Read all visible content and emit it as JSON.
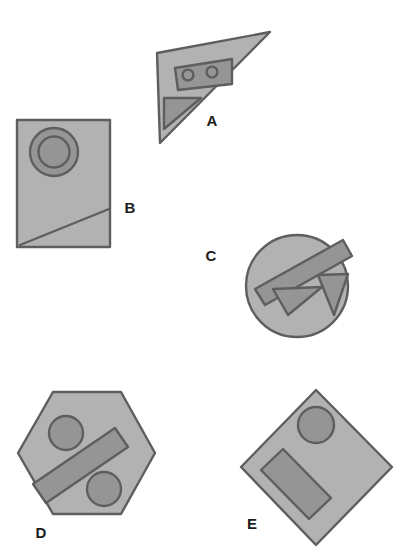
{
  "figure": {
    "background_color": "#ffffff",
    "palette": {
      "shape_fill": "#b2b2b2",
      "shape_outline": "#5e5e5e",
      "feature_fill": "#959595",
      "feature_outline": "#5e5e5e",
      "label_color": "#1b1b1b"
    },
    "stroke_width": 2.4,
    "shapes": [
      {
        "id": "A",
        "label": "A",
        "outline": "triangle",
        "points": "157,53 270,32 160,143",
        "label_x": 212,
        "label_y": 122,
        "features": [
          {
            "name": "inner-rectangle",
            "type": "polygon",
            "points": "175,68 232,59 232,84 178,90"
          },
          {
            "name": "inner-circle-left",
            "type": "circle",
            "cx": 188,
            "cy": 75,
            "r": 5.4
          },
          {
            "name": "inner-circle-right",
            "type": "circle",
            "cx": 212,
            "cy": 72,
            "r": 5.4
          },
          {
            "name": "inner-triangle",
            "type": "polygon",
            "points": "164,98 201,98 164,129"
          }
        ]
      },
      {
        "id": "B",
        "label": "B",
        "outline": "rectangle",
        "points": "17,120 110,120 110,247 17,247",
        "label_x": 130,
        "label_y": 209,
        "features": [
          {
            "name": "outer-ring",
            "type": "circle",
            "cx": 54,
            "cy": 152,
            "r": 24
          },
          {
            "name": "inner-ring",
            "type": "circle",
            "cx": 54,
            "cy": 152,
            "r": 15.5
          },
          {
            "name": "diagonal-line",
            "type": "line",
            "x1": 20,
            "y1": 245,
            "x2": 109,
            "y2": 209
          }
        ]
      },
      {
        "id": "C",
        "label": "C",
        "outline": "circle",
        "cx": 297,
        "cy": 286,
        "r": 51,
        "label_x": 211,
        "label_y": 257,
        "features": [
          {
            "name": "diagonal-bar",
            "type": "polygon",
            "points": "255,289 343,240 352,256 265,305"
          },
          {
            "name": "triangle-left",
            "type": "polygon",
            "points": "273,289 322,287 288,315"
          },
          {
            "name": "triangle-right",
            "type": "polygon",
            "points": "318,275 348,274 334,315"
          }
        ]
      },
      {
        "id": "D",
        "label": "D",
        "outline": "hexagon",
        "points": "18,453 53,392 121,392 155,453 121,514 53,514",
        "label_x": 41,
        "label_y": 534,
        "features": [
          {
            "name": "circle-top",
            "type": "circle",
            "cx": 66,
            "cy": 433,
            "r": 17
          },
          {
            "name": "circle-bottom",
            "type": "circle",
            "cx": 104,
            "cy": 489,
            "r": 17
          },
          {
            "name": "diagonal-bar",
            "type": "polygon",
            "points": "33,484 115,428 128,447 46,503"
          }
        ]
      },
      {
        "id": "E",
        "label": "E",
        "outline": "diamond",
        "points": "316,390 392,467 316,545 241,467",
        "label_x": 252,
        "label_y": 525,
        "features": [
          {
            "name": "circle-top",
            "type": "circle",
            "cx": 316,
            "cy": 425,
            "r": 18
          },
          {
            "name": "diagonal-bar",
            "type": "polygon",
            "points": "261,470 283,449 331,498 309,519"
          }
        ]
      }
    ]
  }
}
